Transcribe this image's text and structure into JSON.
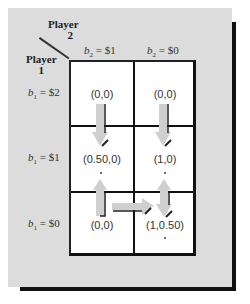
{
  "header": {
    "player2_label_line1": "Player",
    "player2_label_line2": "2",
    "player1_label_line1": "Player",
    "player1_label_line2": "1"
  },
  "columns": [
    {
      "var": "b",
      "sub": "2",
      "label": " = $1"
    },
    {
      "var": "b",
      "sub": "2",
      "label": " = $0"
    }
  ],
  "rows": [
    {
      "var": "b",
      "sub": "1",
      "label": " = $2"
    },
    {
      "var": "b",
      "sub": "1",
      "label": " = $1"
    },
    {
      "var": "b",
      "sub": "1",
      "label": " = $0"
    }
  ],
  "cells": [
    [
      "(0,0)",
      "(0,0)"
    ],
    [
      "(0.50,0)",
      "(1,0)"
    ],
    [
      "(0,0)",
      "(1,0.50)"
    ]
  ],
  "arrows": [
    {
      "from": "r1c1",
      "to": "r2c1",
      "direction": "down"
    },
    {
      "from": "r1c2",
      "to": "r2c2",
      "direction": "down"
    },
    {
      "from": "r3c1",
      "to": "r2c1",
      "direction": "up"
    },
    {
      "from": "r3c1",
      "to": "r3c2",
      "direction": "right"
    },
    {
      "from": "r3c2",
      "to": "r2c2",
      "direction": "up-and-down"
    }
  ],
  "colors": {
    "panel": "#dcdcdc",
    "shadow": "#111111",
    "cell": "#ffffff",
    "arrow_fill": "#cfcfcf",
    "arrow_edge": "#222222"
  }
}
